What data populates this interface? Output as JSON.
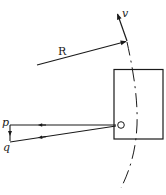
{
  "diagram": {
    "labels": {
      "R": "R",
      "v": "v",
      "O": "O",
      "p": "p",
      "q": "q"
    },
    "colors": {
      "stroke": "#1a1a1a",
      "background": "#ffffff"
    },
    "elements": [
      {
        "id": "R",
        "type": "vector-arrow",
        "from": [
          37,
          65
        ],
        "to": [
          127,
          41
        ]
      },
      {
        "id": "v",
        "type": "vector-arrow",
        "from": [
          127,
          41
        ],
        "to": [
          117,
          13
        ]
      },
      {
        "id": "orbit",
        "type": "dashed-arc"
      },
      {
        "id": "frame",
        "type": "rectangle",
        "x": 114,
        "y": 69,
        "w": 49,
        "h": 70
      },
      {
        "id": "O",
        "type": "origin-circle",
        "center": [
          121,
          125
        ]
      },
      {
        "id": "p",
        "type": "line-with-arrow",
        "from": [
          115,
          125
        ],
        "to": [
          10,
          125
        ]
      },
      {
        "id": "q",
        "type": "line-with-arrow",
        "from": [
          115,
          126
        ],
        "to": [
          10,
          142
        ]
      },
      {
        "id": "pq",
        "type": "short-arrow",
        "from": [
          10,
          126
        ],
        "to": [
          10,
          140
        ]
      }
    ]
  }
}
